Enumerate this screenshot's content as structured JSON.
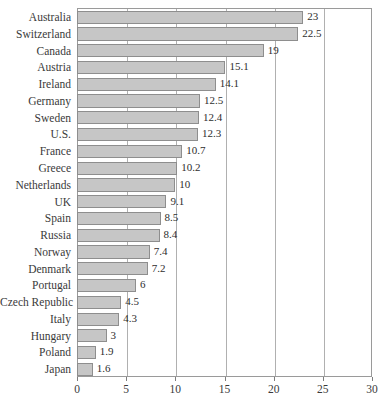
{
  "chart_data": {
    "type": "bar",
    "orientation": "horizontal",
    "title": "",
    "subtitle": "",
    "xlabel": "",
    "ylabel": "",
    "xlim": [
      0,
      30
    ],
    "xticks": [
      0,
      5,
      10,
      15,
      20,
      25,
      30
    ],
    "xtick_labels": [
      "0",
      "5",
      "10",
      "15",
      "20",
      "25",
      "30"
    ],
    "grid": true,
    "grid_axis": "x",
    "legend": null,
    "categories": [
      "Australia",
      "Switzerland",
      "Canada",
      "Austria",
      "Ireland",
      "Germany",
      "Sweden",
      "U.S.",
      "France",
      "Greece",
      "Netherlands",
      "UK",
      "Spain",
      "Russia",
      "Norway",
      "Denmark",
      "Portugal",
      "Czech Republic",
      "Italy",
      "Hungary",
      "Poland",
      "Japan"
    ],
    "values": [
      23,
      22.5,
      19,
      15.1,
      14.1,
      12.5,
      12.4,
      12.3,
      10.7,
      10.2,
      10,
      9.1,
      8.5,
      8.4,
      7.4,
      7.2,
      6,
      4.5,
      4.3,
      3,
      1.9,
      1.6
    ],
    "value_labels": [
      "23",
      "22.5",
      "19",
      "15.1",
      "14.1",
      "12.5",
      "12.4",
      "12.3",
      "10.7",
      "10.2",
      "10",
      "9.1",
      "8.5",
      "8.4",
      "7.4",
      "7.2",
      "6",
      "4.5",
      "4.3",
      "3",
      "1.9",
      "1.6"
    ],
    "colors": {
      "bar_fill": "#c6c6c6",
      "bar_border": "#8e8e8e",
      "frame": "#9a9a9a",
      "gridline": "#b0b0b0",
      "text": "#3a3a3a"
    }
  },
  "caption": {
    "cutoff_text": ""
  }
}
